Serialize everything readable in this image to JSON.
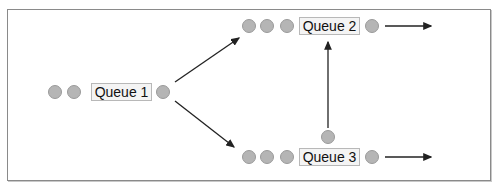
{
  "diagram": {
    "queues": [
      {
        "id": "queue1",
        "label": "Queue 1"
      },
      {
        "id": "queue2",
        "label": "Queue 2"
      },
      {
        "id": "queue3",
        "label": "Queue 3"
      }
    ],
    "edges": [
      {
        "from": "queue1",
        "to": "queue2"
      },
      {
        "from": "queue1",
        "to": "queue3"
      },
      {
        "from": "queue3",
        "to": "queue2"
      },
      {
        "from": "queue2",
        "to": "exit"
      },
      {
        "from": "queue3",
        "to": "exit"
      }
    ],
    "colors": {
      "item": "#b5b5b5",
      "arrow": "#222222",
      "frame": "#8a8a8a"
    }
  }
}
